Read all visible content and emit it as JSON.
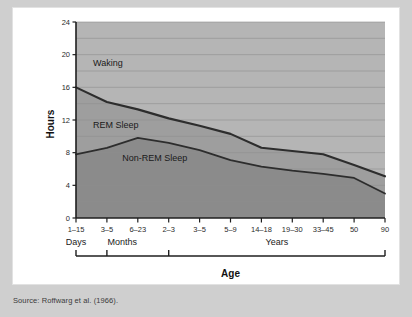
{
  "figure": {
    "y_axis_title": "Hours",
    "x_axis_title": "Age",
    "source_note": "Source: Roffwarg et al. (1966)."
  },
  "chart_data": {
    "type": "area",
    "title": "",
    "xlabel": "Age",
    "ylabel": "Hours",
    "ylim": [
      0,
      24
    ],
    "yticks": [
      0,
      4,
      8,
      12,
      16,
      20,
      24
    ],
    "grid": true,
    "legend_position": "inline-annotations",
    "categories": [
      "1-15",
      "3-5",
      "6-23",
      "2-3",
      "3-5",
      "5-9",
      "14-18",
      "19-30",
      "33-45",
      "50",
      "90"
    ],
    "category_units": [
      "Days",
      "Months",
      "Months",
      "Years",
      "Years",
      "Years",
      "Years",
      "Years",
      "Years",
      "Years",
      "Years"
    ],
    "x": [
      0,
      1,
      2,
      3,
      4,
      5,
      6,
      7,
      8,
      9,
      10
    ],
    "series": [
      {
        "name": "Total Sleep",
        "values": [
          16.0,
          14.2,
          13.3,
          12.2,
          11.3,
          10.3,
          8.6,
          8.2,
          7.8,
          6.5,
          5.1
        ]
      },
      {
        "name": "Non-REM Sleep",
        "values": [
          7.8,
          8.6,
          9.8,
          9.2,
          8.3,
          7.1,
          6.3,
          5.8,
          5.4,
          4.9,
          3.0
        ]
      }
    ],
    "bands": [
      {
        "name": "Waking",
        "label": "Waking",
        "color": "#b5b5b5",
        "from": "total-sleep",
        "to": 24
      },
      {
        "name": "REM Sleep",
        "label": "REM Sleep",
        "color": "#9e9e9e",
        "from": "non-rem",
        "to": "total-sleep"
      },
      {
        "name": "Non-REM Sleep",
        "label": "Non-REM Sleep",
        "color": "#8b8b8b",
        "from": 0,
        "to": "non-rem"
      }
    ],
    "annotations": [
      {
        "text": "Waking",
        "x_frac": 0.055,
        "y_value": 18.6
      },
      {
        "text": "REM Sleep",
        "x_frac": 0.055,
        "y_value": 11.0
      },
      {
        "text": "Non-REM Sleep",
        "x_frac": 0.15,
        "y_value": 7.0
      }
    ],
    "group_brackets": [
      {
        "label": "Days",
        "start_index": 0,
        "end_index": 0
      },
      {
        "label": "Months",
        "start_index": 1,
        "end_index": 2
      },
      {
        "label": "Years",
        "start_index": 3,
        "end_index": 10
      }
    ],
    "colors": {
      "waking_band": "#b5b5b5",
      "rem_band": "#9e9e9e",
      "nonrem_band": "#8b8b8b",
      "curve": "#2d2d2d",
      "gridline": "#8f8f8f",
      "axis": "#1f1f1f",
      "plot_background": "#a8a8a8"
    }
  }
}
